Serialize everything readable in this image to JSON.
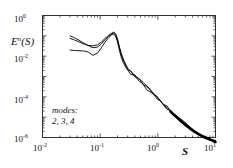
{
  "chart_data": {
    "type": "line",
    "title": "",
    "xlabel": "S",
    "ylabel": "E^n(S)",
    "xscale": "log",
    "yscale": "log",
    "xlim": [
      0.01,
      10
    ],
    "ylim": [
      1e-06,
      1
    ],
    "grid": false,
    "legend_position": "inside-lower-left",
    "annotations": [
      {
        "text_line1": "modes:",
        "text_line2": "2, 3, 4",
        "x": 0.02,
        "y": 2e-05
      }
    ],
    "xticks": [
      {
        "value": 0.01,
        "mantissa": "10",
        "exponent": "-2"
      },
      {
        "value": 0.1,
        "mantissa": "10",
        "exponent": "-1"
      },
      {
        "value": 1,
        "mantissa": "10",
        "exponent": "0"
      },
      {
        "value": 10,
        "mantissa": "10",
        "exponent": "1"
      }
    ],
    "yticks": [
      {
        "value": 1,
        "mantissa": "10",
        "exponent": "0"
      },
      {
        "value": 0.01,
        "mantissa": "10",
        "exponent": "-2"
      },
      {
        "value": 0.0001,
        "mantissa": "10",
        "exponent": "-4"
      },
      {
        "value": 1e-06,
        "mantissa": "10",
        "exponent": "-6"
      }
    ],
    "series": [
      {
        "name": "mode 2",
        "color": "#000000",
        "x": [
          0.03,
          0.036,
          0.043,
          0.052,
          0.062,
          0.075,
          0.09,
          0.105,
          0.122,
          0.14,
          0.155,
          0.17,
          0.185,
          0.2,
          0.215,
          0.232,
          0.25,
          0.275,
          0.3,
          0.34,
          0.38,
          0.43,
          0.49,
          0.56,
          0.64,
          0.73,
          0.84,
          0.96,
          1.1,
          1.26,
          1.45,
          1.66,
          1.9,
          2.2,
          2.5,
          2.9,
          3.3,
          3.8,
          4.4,
          5.0,
          5.8,
          6.6,
          7.6,
          8.7,
          10.0
        ],
        "y": [
          0.1,
          0.08,
          0.06,
          0.044,
          0.033,
          0.026,
          0.028,
          0.04,
          0.065,
          0.095,
          0.115,
          0.12,
          0.1,
          0.05,
          0.02,
          0.009,
          0.005,
          0.003,
          0.0021,
          0.0015,
          0.0011,
          0.0008,
          0.00055,
          0.00038,
          0.00026,
          0.00018,
          0.000125,
          8.5e-05,
          5.8e-05,
          4e-05,
          2.8e-05,
          1.9e-05,
          1.3e-05,
          9e-06,
          6.5e-06,
          4.6e-06,
          3.4e-06,
          2.5e-06,
          1.9e-06,
          1.5e-06,
          1.2e-06,
          1e-06,
          8.5e-07,
          7.2e-07,
          6e-07
        ]
      },
      {
        "name": "mode 3",
        "color": "#000000",
        "x": [
          0.03,
          0.036,
          0.043,
          0.052,
          0.062,
          0.075,
          0.09,
          0.105,
          0.122,
          0.14,
          0.155,
          0.17,
          0.185,
          0.2,
          0.215,
          0.232,
          0.25,
          0.275,
          0.3,
          0.34,
          0.38,
          0.43,
          0.49,
          0.56,
          0.64,
          0.73,
          0.84,
          0.96,
          1.1,
          1.26,
          1.45,
          1.66,
          1.9,
          2.2,
          2.5,
          2.9,
          3.3,
          3.8,
          4.4,
          5.0,
          5.8,
          6.6,
          7.6,
          8.7,
          10.0
        ],
        "y": [
          0.075,
          0.062,
          0.05,
          0.04,
          0.034,
          0.032,
          0.036,
          0.05,
          0.075,
          0.105,
          0.13,
          0.14,
          0.11,
          0.06,
          0.026,
          0.012,
          0.0065,
          0.0036,
          0.0024,
          0.0017,
          0.00125,
          0.0009,
          0.00062,
          0.00042,
          0.00029,
          0.0002,
          0.000135,
          9.2e-05,
          6.3e-05,
          4.3e-05,
          3e-05,
          2.05e-05,
          1.4e-05,
          9.6e-06,
          6.9e-06,
          4.9e-06,
          3.6e-06,
          2.65e-06,
          2e-06,
          1.6e-06,
          1.25e-06,
          1.05e-06,
          8.8e-07,
          7.5e-07,
          6.3e-07
        ]
      },
      {
        "name": "mode 4",
        "color": "#000000",
        "x": [
          0.03,
          0.036,
          0.043,
          0.052,
          0.062,
          0.075,
          0.09,
          0.105,
          0.122,
          0.14,
          0.155,
          0.17,
          0.185,
          0.2,
          0.215,
          0.232,
          0.25,
          0.275,
          0.3,
          0.34,
          0.38,
          0.43,
          0.49,
          0.56,
          0.64,
          0.73,
          0.84,
          0.96,
          1.1,
          1.26,
          1.45,
          1.66,
          1.9,
          2.2,
          2.5,
          2.9,
          3.3,
          3.8,
          4.4,
          5.0,
          5.8,
          6.6,
          7.6,
          8.7,
          10.0
        ],
        "y": [
          0.02,
          0.019,
          0.0185,
          0.018,
          0.016,
          0.011,
          0.014,
          0.026,
          0.05,
          0.08,
          0.105,
          0.155,
          0.13,
          0.07,
          0.03,
          0.014,
          0.0075,
          0.0042,
          0.0028,
          0.0019,
          0.0014,
          0.001,
          0.00069,
          0.00047,
          0.00032,
          0.00022,
          0.000145,
          0.0001,
          6.8e-05,
          4.6e-05,
          3.2e-05,
          2.2e-05,
          1.5e-05,
          1e-05,
          7.3e-06,
          5.2e-06,
          3.8e-06,
          2.8e-06,
          2.1e-06,
          1.7e-06,
          1.3e-06,
          1.1e-06,
          9.2e-07,
          7.8e-07,
          6.6e-07
        ]
      }
    ]
  },
  "plot": {
    "frame_color": "#333333",
    "background": "#ffffff",
    "curve_color": "#000000"
  }
}
